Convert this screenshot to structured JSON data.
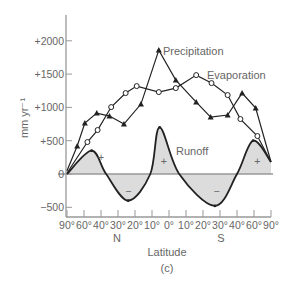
{
  "chart_data": {
    "type": "line",
    "title": "",
    "caption": "(c)",
    "xlabel": "Latitude",
    "ylabel": "mm yr⁻¹",
    "ylim": [
      -600,
      2400
    ],
    "yticks": [
      {
        "value": 2000,
        "label": "+2000"
      },
      {
        "value": 1500,
        "label": "+1500"
      },
      {
        "value": 1000,
        "label": "+1000"
      },
      {
        "value": 500,
        "label": "+500"
      },
      {
        "value": 0,
        "label": "0"
      },
      {
        "value": -500,
        "label": "−500"
      }
    ],
    "x_ticks": [
      "90°",
      "60°",
      "40°",
      "30°",
      "20°",
      "10°",
      "0°",
      "10°",
      "20°",
      "30°",
      "40°",
      "60°",
      "90°"
    ],
    "hemisphere_labels": {
      "north": "N",
      "south": "S"
    },
    "grid": false,
    "series": [
      {
        "name": "Precipitation",
        "marker": "triangle",
        "points": [
          {
            "x": 0.0,
            "y": 50
          },
          {
            "x": 0.6,
            "y": 420
          },
          {
            "x": 1.05,
            "y": 765
          },
          {
            "x": 1.75,
            "y": 915
          },
          {
            "x": 2.5,
            "y": 870
          },
          {
            "x": 3.35,
            "y": 750
          },
          {
            "x": 4.35,
            "y": 1050
          },
          {
            "x": 5.4,
            "y": 1860
          },
          {
            "x": 6.4,
            "y": 1410
          },
          {
            "x": 7.6,
            "y": 1080
          },
          {
            "x": 8.45,
            "y": 855
          },
          {
            "x": 9.45,
            "y": 885
          },
          {
            "x": 10.3,
            "y": 1215
          },
          {
            "x": 11.1,
            "y": 990
          },
          {
            "x": 12.0,
            "y": 180
          }
        ]
      },
      {
        "name": "Evaporation",
        "marker": "circle",
        "points": [
          {
            "x": 0.0,
            "y": 15
          },
          {
            "x": 1.2,
            "y": 480
          },
          {
            "x": 1.8,
            "y": 660
          },
          {
            "x": 2.6,
            "y": 1005
          },
          {
            "x": 3.45,
            "y": 1215
          },
          {
            "x": 4.1,
            "y": 1320
          },
          {
            "x": 5.4,
            "y": 1230
          },
          {
            "x": 6.4,
            "y": 1290
          },
          {
            "x": 7.6,
            "y": 1485
          },
          {
            "x": 8.5,
            "y": 1365
          },
          {
            "x": 9.45,
            "y": 1185
          },
          {
            "x": 10.2,
            "y": 825
          },
          {
            "x": 11.2,
            "y": 570
          },
          {
            "x": 12.0,
            "y": 180
          }
        ]
      },
      {
        "name": "Runoff",
        "marker": "dot",
        "fill": "#dcdcdc",
        "points": [
          {
            "x": 0.0,
            "y": 0
          },
          {
            "x": 1.45,
            "y": 350
          },
          {
            "x": 2.3,
            "y": 0
          },
          {
            "x": 3.6,
            "y": -400
          },
          {
            "x": 4.9,
            "y": 0
          },
          {
            "x": 5.45,
            "y": 700
          },
          {
            "x": 6.6,
            "y": 0
          },
          {
            "x": 8.7,
            "y": -480
          },
          {
            "x": 10.0,
            "y": 0
          },
          {
            "x": 10.95,
            "y": 500
          },
          {
            "x": 12.0,
            "y": 180
          }
        ],
        "region_signs": [
          {
            "x": 2.0,
            "y": 250,
            "label": "+"
          },
          {
            "x": 3.6,
            "y": -250,
            "label": "−"
          },
          {
            "x": 5.7,
            "y": 200,
            "label": "+"
          },
          {
            "x": 8.8,
            "y": -250,
            "label": "−"
          },
          {
            "x": 11.2,
            "y": 200,
            "label": "+"
          }
        ]
      }
    ],
    "colors": {
      "line": "#222222",
      "axis": "#999999",
      "text": "#666666",
      "runoff_fill": "#dcdcdc"
    }
  }
}
